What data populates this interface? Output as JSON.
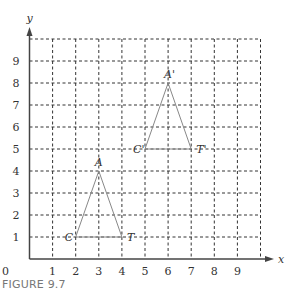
{
  "figure": {
    "caption": "FIGURE 9.7",
    "x_axis_label": "x",
    "y_axis_label": "y",
    "origin_label": "0",
    "x_ticks": [
      "1",
      "2",
      "3",
      "4",
      "5",
      "6",
      "7",
      "8",
      "9"
    ],
    "y_ticks": [
      "1",
      "2",
      "3",
      "4",
      "5",
      "6",
      "7",
      "8",
      "9"
    ],
    "grid": {
      "xmin": 0,
      "xmax": 10,
      "ymin": 0,
      "ymax": 10,
      "style": "dashed"
    },
    "colors": {
      "grid": "#333333",
      "axis": "#444444",
      "triangle": "#888888",
      "text": "#333333",
      "caption": "#777777"
    }
  },
  "chart_data": {
    "type": "scatter",
    "title": "",
    "caption": "FIGURE 9.7",
    "xlabel": "x",
    "ylabel": "y",
    "xlim": [
      0,
      10
    ],
    "ylim": [
      0,
      10
    ],
    "grid": true,
    "shapes": [
      {
        "name": "Triangle ACT",
        "vertices": [
          {
            "label": "A",
            "x": 3,
            "y": 4
          },
          {
            "label": "C",
            "x": 2,
            "y": 1
          },
          {
            "label": "T",
            "x": 4,
            "y": 1
          }
        ]
      },
      {
        "name": "Triangle A'C'T'",
        "vertices": [
          {
            "label": "A'",
            "x": 6,
            "y": 8
          },
          {
            "label": "C'",
            "x": 5,
            "y": 5
          },
          {
            "label": "T'",
            "x": 7,
            "y": 5
          }
        ]
      }
    ]
  }
}
